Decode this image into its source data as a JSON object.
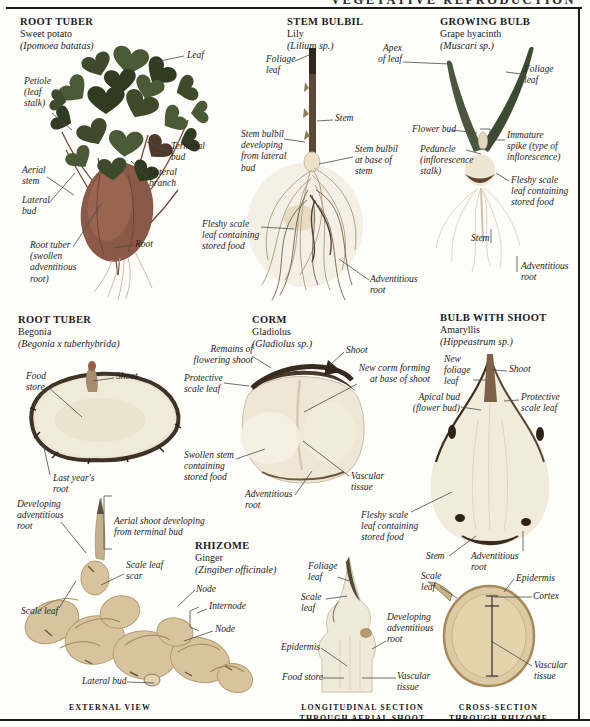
{
  "page": {
    "header": "VEGETATIVE REPRODUCTION"
  },
  "sections": {
    "sweet_potato": {
      "title": "ROOT TUBER",
      "common": "Sweet potato",
      "latin": "(Ipomoea batatas)",
      "labels": {
        "leaf": "Leaf",
        "petiole": "Petiole\n(leaf\nstalk)",
        "terminal_bud": "Terminal\nbud",
        "aerial_stem": "Aerial\nstem",
        "lateral_branch": "Lateral\nbranch",
        "lateral_bud": "Lateral\nbud",
        "root_tuber": "Root tuber\n(swollen\nadventitious\nroot)",
        "root": "Root"
      }
    },
    "stem_bulbil": {
      "title": "STEM BULBIL",
      "common": "Lily",
      "latin": "(Lilium sp.)",
      "labels": {
        "foliage_leaf": "Foliage\nleaf",
        "stem": "Stem",
        "bulbil_lateral": "Stem bulbil\ndeveloping\nfrom lateral\nbud",
        "bulbil_base": "Stem bulbil\nat base of\nstem",
        "fleshy_scale": "Fleshy scale\nleaf containing\nstored food",
        "adventitious_root": "Adventitious\nroot"
      }
    },
    "growing_bulb": {
      "title": "GROWING BULB",
      "common": "Grape hyacinth",
      "latin": "(Muscari sp.)",
      "labels": {
        "apex_of_leaf": "Apex\nof leaf",
        "foliage_leaf": "Foliage\nleaf",
        "flower_bud": "Flower bud",
        "immature_spike": "Immature\nspike (type of\ninflorescence)",
        "peduncle": "Peduncle\n(inflorescence\nstalk)",
        "fleshy_scale": "Fleshy scale\nleaf containing\nstored food",
        "stem": "Stem",
        "adventitious_root": "Adventitious\nroot"
      }
    },
    "begonia": {
      "title": "ROOT TUBER",
      "common": "Begonia",
      "latin": "(Begonia x tuberhybrida)",
      "labels": {
        "food_store": "Food\nstore",
        "shoot": "Shoot",
        "last_years_root": "Last year's\nroot"
      }
    },
    "corm": {
      "title": "CORM",
      "common": "Gladiolus",
      "latin": "(Gladiolus sp.)",
      "labels": {
        "remains": "Remains of\nflowering shoot",
        "shoot": "Shoot",
        "protective_scale": "Protective\nscale leaf",
        "new_corm": "New corm forming\nat base of shoot",
        "swollen_stem": "Swollen stem\ncontaining\nstored food",
        "vascular": "Vascular\ntissue",
        "adventitious_root": "Adventitious\nroot"
      }
    },
    "bulb_with_shoot": {
      "title": "BULB WITH SHOOT",
      "common": "Amaryllis",
      "latin": "(Hippeastrum sp.)",
      "labels": {
        "new_foliage_leaf": "New\nfoliage\nleaf",
        "shoot": "Shoot",
        "apical_bud": "Apical bud\n(flower bud)",
        "protective_scale": "Protective\nscale leaf",
        "fleshy_scale": "Fleshy scale\nleaf containing\nstored food",
        "stem": "Stem",
        "adventitious_root": "Adventitious\nroot"
      }
    },
    "rhizome": {
      "title": "RHIZOME",
      "common": "Ginger",
      "latin": "(Zingiber officinale)",
      "labels": {
        "developing_adv_root": "Developing\nadventitious\nroot",
        "aerial_shoot": "Aerial shoot developing\nfrom terminal bud",
        "scale_leaf_scar": "Scale leaf\nscar",
        "node_upper": "Node",
        "internode": "Internode",
        "node_lower": "Node",
        "scale_leaf": "Scale leaf",
        "lateral_bud": "Lateral bud"
      },
      "caption": "EXTERNAL VIEW"
    },
    "longitudinal_section": {
      "labels": {
        "foliage_leaf": "Foliage\nleaf",
        "scale_leaf": "Scale\nleaf",
        "developing_adv_root": "Developing\nadventitious\nroot",
        "epidermis": "Epidermis",
        "food_store": "Food store",
        "vascular": "Vascular\ntissue"
      },
      "caption": "LONGITUDINAL SECTION\nTHROUGH AERIAL SHOOT"
    },
    "cross_section": {
      "labels": {
        "scale_leaf": "Scale\nleaf",
        "epidermis": "Epidermis",
        "cortex": "Cortex",
        "vascular": "Vascular\ntissue"
      },
      "caption": "CROSS-SECTION\nTHROUGH RHIZOME"
    }
  },
  "colors": {
    "leaf_green": "#3d4a2b",
    "tuber_brown": "#8a5948",
    "bulb_cream": "#ece5d1",
    "ginger_tan": "#d7c49f",
    "leader_line": "#4a4a4a",
    "text": "#1c1c1c"
  }
}
